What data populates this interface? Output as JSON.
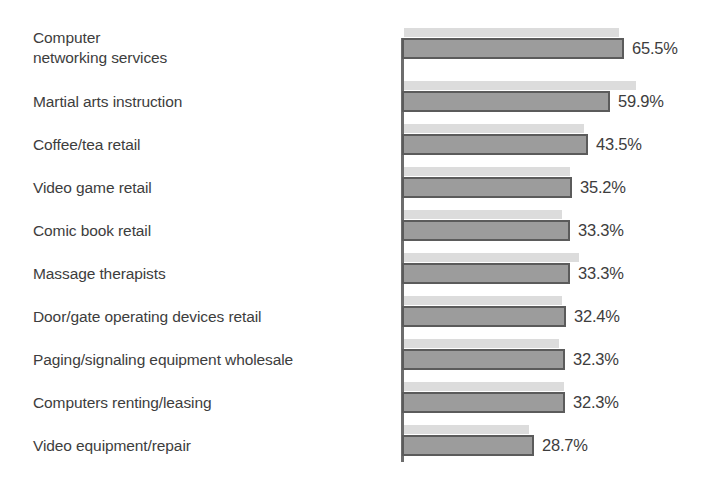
{
  "chart_data": {
    "type": "bar",
    "orientation": "horizontal",
    "title": "",
    "subtitle": "",
    "xlabel": "",
    "ylabel": "",
    "grid": false,
    "legend": null,
    "value_suffix": "%",
    "axis_visible": "category-axis-vertical-line",
    "categories": [
      "Computer\nnetworking services",
      "Martial arts instruction",
      "Coffee/tea retail",
      "Video game retail",
      "Comic book retail",
      "Massage therapists",
      "Door/gate operating devices retail",
      "Paging/signaling equipment wholesale",
      "Computers renting/leasing",
      "Video equipment/repair"
    ],
    "values": [
      65.5,
      59.9,
      43.5,
      35.2,
      33.3,
      33.3,
      32.4,
      32.3,
      32.3,
      28.7
    ],
    "value_labels": [
      "65.5%",
      "59.9%",
      "43.5%",
      "35.2%",
      "33.3%",
      "33.3%",
      "32.4%",
      "32.3%",
      "32.3%",
      "28.7%"
    ],
    "xlim": [
      0,
      65.5
    ],
    "bar_pixel_widths": [
      222,
      208,
      186,
      170,
      168,
      168,
      164,
      163,
      163,
      132
    ],
    "colors": {
      "bar_fill": "#9c9c9c",
      "bar_border": "#5b5b5b",
      "shadow_bar": "#dcdcdc",
      "axis": "#6d6d6d",
      "text": "#3d3d3d",
      "background": "#ffffff"
    }
  },
  "rows": [
    {
      "label": "Computer\nnetworking services",
      "value_label": "65.5%",
      "bar_w": 222,
      "ghost_w": 215,
      "top": 38,
      "label_top": 28,
      "two_line": true
    },
    {
      "label": "Martial arts instruction",
      "value_label": "59.9%",
      "bar_w": 208,
      "ghost_w": 232,
      "top": 91,
      "label_top": 92,
      "two_line": false
    },
    {
      "label": "Coffee/tea retail",
      "value_label": "43.5%",
      "bar_w": 186,
      "ghost_w": 180,
      "top": 134,
      "label_top": 135,
      "two_line": false
    },
    {
      "label": "Video game retail",
      "value_label": "35.2%",
      "bar_w": 170,
      "ghost_w": 166,
      "top": 177,
      "label_top": 178,
      "two_line": false
    },
    {
      "label": "Comic book retail",
      "value_label": "33.3%",
      "bar_w": 168,
      "ghost_w": 158,
      "top": 220,
      "label_top": 221,
      "two_line": false
    },
    {
      "label": "Massage therapists",
      "value_label": "33.3%",
      "bar_w": 168,
      "ghost_w": 175,
      "top": 263,
      "label_top": 264,
      "two_line": false
    },
    {
      "label": "Door/gate operating devices retail",
      "value_label": "32.4%",
      "bar_w": 164,
      "ghost_w": 158,
      "top": 306,
      "label_top": 307,
      "two_line": false
    },
    {
      "label": "Paging/signaling equipment wholesale",
      "value_label": "32.3%",
      "bar_w": 163,
      "ghost_w": 155,
      "top": 349,
      "label_top": 350,
      "two_line": false
    },
    {
      "label": "Computers renting/leasing",
      "value_label": "32.3%",
      "bar_w": 163,
      "ghost_w": 160,
      "top": 392,
      "label_top": 393,
      "two_line": false
    },
    {
      "label": "Video equipment/repair",
      "value_label": "28.7%",
      "bar_w": 132,
      "ghost_w": 125,
      "top": 435,
      "label_top": 436,
      "two_line": false
    }
  ]
}
